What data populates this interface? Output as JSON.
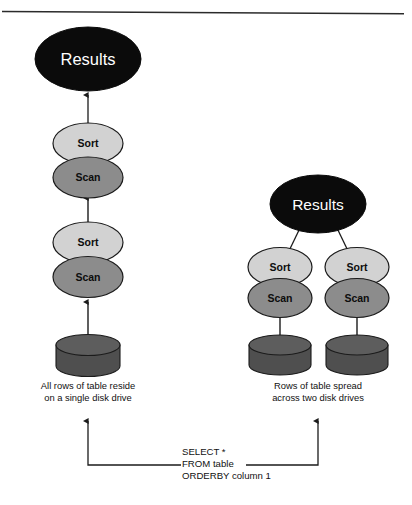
{
  "figure": {
    "type": "diagram",
    "top_rule": {
      "present": true,
      "color": "#2b2b2b"
    }
  },
  "palette": {
    "results_fill": "#0b0b0b",
    "results_text": "#ffffff",
    "sort_fill": "#d2d2d2",
    "scan_fill": "#8c8c8c",
    "disk_body": "#4f4f4f",
    "disk_top": "#5d5d5d",
    "stroke": "#1b1b1b",
    "text": "#111111",
    "background": "#ffffff"
  },
  "left_pipeline": {
    "name": "single-disk-serial-plan",
    "results": {
      "label": "Results"
    },
    "stages": [
      {
        "label": "Sort",
        "kind": "sort"
      },
      {
        "label": "Scan",
        "kind": "scan"
      },
      {
        "label": "Sort",
        "kind": "sort"
      },
      {
        "label": "Scan",
        "kind": "scan"
      }
    ],
    "disks": [
      {
        "label": "disk-drive-1"
      }
    ],
    "caption": {
      "line1": "All rows of table reside",
      "line2": "on a single disk drive"
    }
  },
  "right_pipeline": {
    "name": "two-disk-parallel-plan",
    "results": {
      "label": "Results"
    },
    "branches": [
      {
        "name": "branch-left",
        "stages": [
          {
            "label": "Sort",
            "kind": "sort"
          },
          {
            "label": "Scan",
            "kind": "scan"
          }
        ],
        "disk": {
          "label": "disk-drive-1"
        }
      },
      {
        "name": "branch-right",
        "stages": [
          {
            "label": "Sort",
            "kind": "sort"
          },
          {
            "label": "Scan",
            "kind": "scan"
          }
        ],
        "disk": {
          "label": "disk-drive-2"
        }
      }
    ],
    "caption": {
      "line1": "Rows of table spread",
      "line2": "across two disk drives"
    }
  },
  "query": {
    "name": "sql-query-block",
    "line1": "SELECT *",
    "line2": "FROM table",
    "line3": "ORDERBY column 1"
  }
}
